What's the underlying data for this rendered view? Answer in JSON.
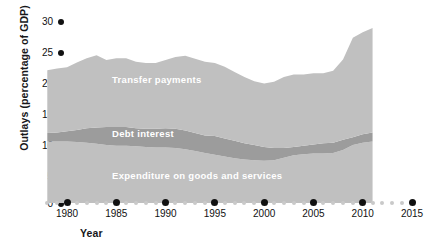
{
  "chart_data": {
    "type": "area",
    "stacked": true,
    "title": "",
    "xlabel": "Year",
    "ylabel": "Outlays (percentage of GDP)",
    "xlim": [
      1978,
      2015
    ],
    "ylim": [
      0,
      32
    ],
    "grid": false,
    "legend_position": "inline-labels",
    "x_ticks": [
      1980,
      1985,
      1990,
      1995,
      2000,
      2005,
      2010,
      2015
    ],
    "y_ticks": [
      0,
      5,
      10,
      15,
      20,
      25,
      30
    ],
    "x": [
      1978,
      1979,
      1980,
      1981,
      1982,
      1983,
      1984,
      1985,
      1986,
      1987,
      1988,
      1989,
      1990,
      1991,
      1992,
      1993,
      1994,
      1995,
      1996,
      1997,
      1998,
      1999,
      2000,
      2001,
      2002,
      2003,
      2004,
      2005,
      2006,
      2007,
      2008,
      2009,
      2010,
      2011
    ],
    "series": [
      {
        "name": "Expenditure on goods and services",
        "color": "#c0c0c0",
        "values": [
          10.2,
          10.2,
          10.2,
          10.1,
          10.0,
          9.8,
          9.6,
          9.5,
          9.5,
          9.4,
          9.3,
          9.2,
          9.2,
          9.1,
          8.9,
          8.6,
          8.3,
          8.0,
          7.7,
          7.4,
          7.2,
          7.1,
          7.0,
          7.1,
          7.5,
          7.9,
          8.1,
          8.2,
          8.2,
          8.3,
          8.8,
          9.6,
          10.0,
          10.2
        ]
      },
      {
        "name": "Debt interest",
        "color": "#9c9c9c",
        "values": [
          1.4,
          1.5,
          1.7,
          2.0,
          2.4,
          2.7,
          3.0,
          3.1,
          3.1,
          3.0,
          3.0,
          3.1,
          3.2,
          3.2,
          3.1,
          3.0,
          2.9,
          3.1,
          3.0,
          2.9,
          2.7,
          2.5,
          2.3,
          2.0,
          1.6,
          1.4,
          1.4,
          1.5,
          1.7,
          1.7,
          1.7,
          1.3,
          1.4,
          1.5
        ]
      },
      {
        "name": "Transfer payments",
        "color": "#c0c0c0",
        "values": [
          10.4,
          10.6,
          10.6,
          11.2,
          11.6,
          12.0,
          11.1,
          11.4,
          11.4,
          11.0,
          10.9,
          10.9,
          11.3,
          11.9,
          12.4,
          12.3,
          12.2,
          12.1,
          11.9,
          11.4,
          11.0,
          10.6,
          10.5,
          11.0,
          11.8,
          12.0,
          11.8,
          11.8,
          11.6,
          11.9,
          13.3,
          16.5,
          16.9,
          17.3
        ]
      }
    ],
    "cumulative_top": [
      22.0,
      22.3,
      22.5,
      23.3,
      24.0,
      24.5,
      23.7,
      24.0,
      24.0,
      23.4,
      23.2,
      23.2,
      23.7,
      24.2,
      24.4,
      23.9,
      23.4,
      23.2,
      22.6,
      21.7,
      20.9,
      20.2,
      19.8,
      20.1,
      20.9,
      21.3,
      21.3,
      21.5,
      21.5,
      21.9,
      23.8,
      27.4,
      28.3,
      29.0
    ],
    "annotations": [
      {
        "text": "Transfer payments",
        "series": "Transfer payments"
      },
      {
        "text": "Debt interest",
        "series": "Debt interest"
      },
      {
        "text": "Expenditure on goods and services",
        "series": "Expenditure on goods and services"
      }
    ]
  },
  "axes": {
    "y_title": "Outlays (percentage of GDP)",
    "x_title": "Year",
    "y_tick_labels": [
      "30",
      "25",
      "20",
      "15",
      "10",
      "5",
      "0"
    ],
    "x_tick_labels": [
      "1980",
      "1985",
      "1990",
      "1995",
      "2000",
      "2005",
      "2010",
      "2015"
    ]
  },
  "colors": {
    "area_light": "#c0c0c0",
    "area_mid": "#9c9c9c",
    "axis_text": "#111111",
    "tick_dot_major": "#111111",
    "tick_dot_minor": "#c9c9c9",
    "label_text": "#ffffff",
    "background": "#ffffff"
  }
}
